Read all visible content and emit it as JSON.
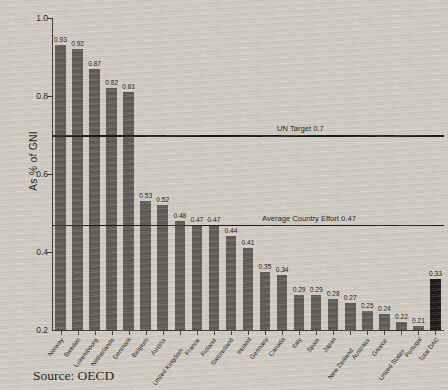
{
  "chart_data": {
    "type": "bar",
    "title": "",
    "xlabel": "",
    "ylabel": "As % of GNI",
    "ylim": [
      0.2,
      1.0
    ],
    "ytick_labels": [
      "1.0",
      "0.8",
      "0.6",
      "0.4",
      "0.2"
    ],
    "ytick_values": [
      1.0,
      0.8,
      0.6,
      0.4,
      0.2
    ],
    "grid": false,
    "legend": "none",
    "categories": [
      "Norway",
      "Sweden",
      "Luxembourg",
      "Netherlands",
      "Denmark",
      "Belgium",
      "Austria",
      "United Kingdom",
      "France",
      "Finland",
      "Switzerland",
      "Ireland",
      "Germany",
      "Canada",
      "Italy",
      "Spain",
      "Japan",
      "New Zealand",
      "Australia",
      "Greece",
      "United States",
      "Portugal",
      "Total DAC"
    ],
    "values": [
      0.93,
      0.92,
      0.87,
      0.82,
      0.81,
      0.53,
      0.52,
      0.48,
      0.47,
      0.47,
      0.44,
      0.41,
      0.35,
      0.34,
      0.29,
      0.29,
      0.28,
      0.27,
      0.25,
      0.24,
      0.22,
      0.21,
      0.33
    ],
    "value_labels": [
      "0.93",
      "0.92",
      "0.87",
      "0.82",
      "0.81",
      "0.53",
      "0.52",
      "0.48",
      "0.47",
      "0.47",
      "0.44",
      "0.41",
      "0.35",
      "0.34",
      "0.29",
      "0.29",
      "0.28",
      "0.27",
      "0.25",
      "0.24",
      "0.22",
      "0.21",
      "0.33"
    ],
    "highlight_index": 22,
    "bar_color": "#58544f",
    "highlight_color": "#15120f",
    "annotations": [
      {
        "label": "UN Target 0.7",
        "value": 0.7
      },
      {
        "label": "Average Country Effort 0.47",
        "value": 0.47
      }
    ]
  },
  "source": "Source: OECD"
}
